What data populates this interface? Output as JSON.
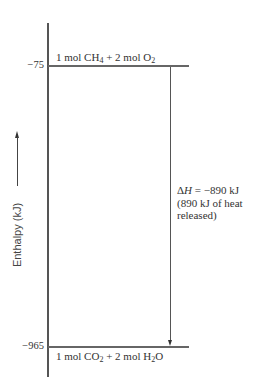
{
  "diagram": {
    "type": "enthalpy-level-diagram",
    "y_axis": {
      "label": "Enthalpy (kJ)",
      "direction_arrow": "up"
    },
    "levels": [
      {
        "id": "reactants",
        "value_label": "−75",
        "value": -75,
        "species": {
          "prefix": "1 mol CH",
          "sub1": "4",
          "mid": " + 2 mol O",
          "sub2": "2",
          "suffix": ""
        }
      },
      {
        "id": "products",
        "value_label": "−965",
        "value": -965,
        "species": {
          "prefix": "1 mol CO",
          "sub1": "2",
          "mid": " + 2 mol H",
          "sub2": "2",
          "suffix": "O"
        }
      }
    ],
    "transition": {
      "from": "reactants",
      "to": "products",
      "arrow_direction": "down",
      "annotation": {
        "line1_symbol": "ΔH",
        "line1_rest": " = −890 kJ",
        "line2": "(890 kJ of heat",
        "line3": "released)"
      }
    }
  }
}
